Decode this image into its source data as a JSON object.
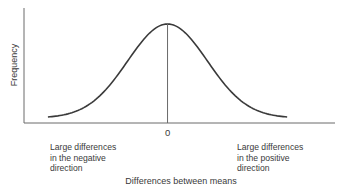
{
  "chart_data": {
    "type": "line",
    "title": "",
    "xlabel": "Differences between means",
    "ylabel": "Frequency",
    "x_ticks": [
      "0"
    ],
    "distribution": "normal",
    "series": [
      {
        "name": "Sampling distribution of differences between means",
        "mean": 0,
        "sd": 1,
        "x_range": [
          -3,
          3
        ]
      }
    ],
    "xlim": [
      -3.6,
      4.2
    ],
    "grid": false,
    "legend": "none",
    "reference_line": {
      "x": 0,
      "label": "0"
    },
    "annotations": [
      {
        "id": "negative",
        "position": "bottom-left",
        "lines": [
          "Large differences",
          "in the negative",
          "direction"
        ]
      },
      {
        "id": "positive",
        "position": "bottom-right",
        "lines": [
          "Large differences",
          "in the positive",
          "direction"
        ]
      }
    ]
  }
}
